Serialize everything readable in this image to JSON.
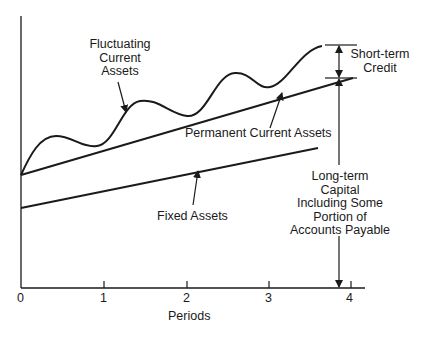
{
  "diagram": {
    "type": "financing-of-assets",
    "x_axis": {
      "label": "Periods",
      "ticks": [
        "0",
        "1",
        "2",
        "3",
        "4"
      ]
    },
    "labels": {
      "fluctuating": [
        "Fluctuating",
        "Current",
        "Assets"
      ],
      "permanent": "Permanent Current Assets",
      "fixed": "Fixed Assets",
      "short_term": [
        "Short-term",
        "Credit"
      ],
      "long_term": [
        "Long-term",
        "Capital",
        "Including Some",
        "Portion of",
        "Accounts Payable"
      ]
    },
    "series": [
      {
        "name": "Fixed Assets",
        "shape": "straight line",
        "start": [
          0,
          "low"
        ],
        "end": [
          3.6,
          "rising"
        ]
      },
      {
        "name": "Permanent Current Assets",
        "shape": "straight line",
        "start": [
          0,
          "mid"
        ],
        "end": [
          4,
          "rising"
        ]
      },
      {
        "name": "Fluctuating Current Assets",
        "shape": "wavy curve above permanent line, rising"
      }
    ],
    "colors": {
      "line": "#1a1a1a",
      "background": "#ffffff"
    }
  }
}
